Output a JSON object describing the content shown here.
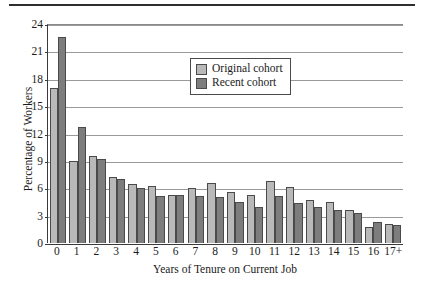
{
  "chart_data": {
    "type": "bar",
    "title": "",
    "xlabel": "Years of Tenure on Current Job",
    "ylabel": "Percentage of Workers",
    "categories": [
      "0",
      "1",
      "2",
      "3",
      "4",
      "5",
      "6",
      "7",
      "8",
      "9",
      "10",
      "11",
      "12",
      "13",
      "14",
      "15",
      "16",
      "17+"
    ],
    "yticks": [
      0,
      3,
      6,
      9,
      12,
      15,
      18,
      21,
      24
    ],
    "ylim": [
      0,
      24
    ],
    "grid": true,
    "legend_position": "upper center",
    "series": [
      {
        "name": "Original cohort",
        "color": "#b9b9b9",
        "values": [
          17.0,
          9.0,
          9.5,
          7.2,
          6.5,
          6.3,
          5.3,
          6.0,
          6.6,
          5.6,
          5.3,
          6.8,
          6.1,
          4.7,
          4.5,
          3.6,
          1.8,
          2.1
        ]
      },
      {
        "name": "Recent cohort",
        "color": "#7d7d7d",
        "values": [
          22.6,
          12.7,
          9.2,
          7.0,
          6.0,
          5.1,
          5.3,
          5.1,
          5.0,
          4.5,
          4.0,
          5.2,
          4.4,
          4.0,
          3.6,
          3.3,
          2.3,
          2.0
        ]
      }
    ]
  },
  "legend": {
    "items": [
      {
        "label": "Original cohort",
        "swatch": "legend-swatch-original"
      },
      {
        "label": "Recent cohort",
        "swatch": "legend-swatch-recent"
      }
    ]
  }
}
